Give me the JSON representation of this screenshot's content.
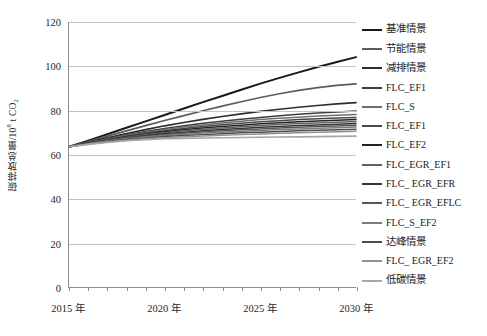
{
  "chart_data": {
    "type": "line",
    "title": "",
    "xlabel": "",
    "ylabel": "碳排放总量/10⁸ t CO₂",
    "ylabel_parts": {
      "prefix": "碳排放总量/10",
      "sup": "8",
      "mid": " t CO",
      "sub": "2"
    },
    "xlim": [
      2015,
      2030
    ],
    "ylim": [
      0,
      120
    ],
    "ytick_step": 20,
    "yticks": [
      0,
      20,
      40,
      60,
      80,
      100,
      120
    ],
    "ytick_labels": [
      "0",
      "20",
      "40",
      "60",
      "80",
      "100",
      "120"
    ],
    "xticks": [
      2015,
      2016,
      2017,
      2018,
      2019,
      2020,
      2021,
      2022,
      2023,
      2024,
      2025,
      2026,
      2027,
      2028,
      2029,
      2030
    ],
    "xtick_labels_shown": [
      "2015 年",
      "2020 年",
      "2025 年",
      "2030 年"
    ],
    "xtick_label_values": [
      2015,
      2020,
      2025,
      2030
    ],
    "grid": true,
    "grid_axis": "y",
    "legend_position": "right",
    "x": [
      2015,
      2016,
      2017,
      2018,
      2019,
      2020,
      2021,
      2022,
      2023,
      2024,
      2025,
      2026,
      2027,
      2028,
      2029,
      2030
    ],
    "series": [
      {
        "name": "基准情景",
        "color": "#1a1a1a",
        "width": 2.0,
        "values": [
          63.5,
          66.3,
          69.2,
          72.1,
          75.0,
          77.9,
          80.8,
          83.7,
          86.5,
          89.3,
          92.1,
          94.7,
          97.2,
          99.6,
          101.9,
          104.1
        ]
      },
      {
        "name": "节能情景",
        "color": "#5c5c5c",
        "width": 1.7,
        "values": [
          63.5,
          65.9,
          68.3,
          70.7,
          73.1,
          75.4,
          77.6,
          79.8,
          81.9,
          83.9,
          85.8,
          87.5,
          89.0,
          90.3,
          91.3,
          92.0
        ]
      },
      {
        "name": "减排情景",
        "color": "#2e2e2e",
        "width": 1.7,
        "values": [
          63.5,
          65.6,
          67.6,
          69.5,
          71.3,
          73.0,
          74.5,
          75.9,
          77.2,
          78.4,
          79.5,
          80.5,
          81.4,
          82.2,
          82.9,
          83.5
        ]
      },
      {
        "name": "FLC_EF1",
        "color": "#3c3c3c",
        "width": 1.5,
        "values": [
          63.5,
          65.4,
          67.2,
          68.9,
          70.4,
          71.8,
          73.0,
          74.1,
          75.1,
          76.0,
          76.8,
          77.5,
          78.2,
          78.8,
          79.3,
          79.7
        ]
      },
      {
        "name": "FLC_S",
        "color": "#707070",
        "width": 1.5,
        "values": [
          63.5,
          65.3,
          67.0,
          68.6,
          70.0,
          71.3,
          72.4,
          73.4,
          74.3,
          75.1,
          75.8,
          76.4,
          76.9,
          77.4,
          77.8,
          78.1
        ]
      },
      {
        "name": "FLC_EF1",
        "color": "#4a4a4a",
        "width": 1.5,
        "values": [
          63.5,
          65.2,
          66.8,
          68.3,
          69.6,
          70.8,
          71.8,
          72.7,
          73.5,
          74.2,
          74.8,
          75.3,
          75.8,
          76.2,
          76.5,
          76.8
        ]
      },
      {
        "name": "FLC_EF2",
        "color": "#242424",
        "width": 1.5,
        "values": [
          63.5,
          65.1,
          66.6,
          68.0,
          69.2,
          70.3,
          71.2,
          72.0,
          72.7,
          73.3,
          73.9,
          74.4,
          74.8,
          75.2,
          75.5,
          75.8
        ]
      },
      {
        "name": "FLC_EGR_EF1",
        "color": "#636363",
        "width": 1.5,
        "values": [
          63.5,
          65.1,
          66.5,
          67.8,
          68.9,
          69.9,
          70.7,
          71.4,
          72.0,
          72.6,
          73.1,
          73.6,
          74.0,
          74.3,
          74.6,
          74.9
        ]
      },
      {
        "name": "FLC_ EGR_EFR",
        "color": "#343434",
        "width": 1.5,
        "values": [
          63.5,
          65.0,
          66.3,
          67.5,
          68.5,
          69.4,
          70.1,
          70.7,
          71.3,
          71.8,
          72.3,
          72.7,
          73.1,
          73.4,
          73.7,
          74.0
        ]
      },
      {
        "name": "FLC_ EGR_EFLC",
        "color": "#575757",
        "width": 1.5,
        "values": [
          63.5,
          64.9,
          66.2,
          67.3,
          68.2,
          69.0,
          69.6,
          70.2,
          70.7,
          71.2,
          71.6,
          72.0,
          72.3,
          72.7,
          72.9,
          73.2
        ]
      },
      {
        "name": "FLC_S_EF2",
        "color": "#7d7d7d",
        "width": 1.5,
        "values": [
          63.5,
          64.9,
          66.1,
          67.1,
          67.9,
          68.6,
          69.2,
          69.7,
          70.1,
          70.5,
          70.9,
          71.3,
          71.6,
          71.9,
          72.1,
          72.4
        ]
      },
      {
        "name": "达峰情景",
        "color": "#4f4f4f",
        "width": 1.5,
        "values": [
          63.5,
          64.8,
          65.9,
          66.8,
          67.5,
          68.1,
          68.6,
          69.0,
          69.4,
          69.8,
          70.1,
          70.4,
          70.7,
          71.0,
          71.2,
          71.4
        ]
      },
      {
        "name": "FLC_ EGR_EF2",
        "color": "#909090",
        "width": 1.5,
        "values": [
          63.5,
          64.7,
          65.7,
          66.5,
          67.1,
          67.6,
          68.0,
          68.4,
          68.7,
          69.0,
          69.3,
          69.6,
          69.9,
          70.1,
          70.3,
          70.5
        ]
      },
      {
        "name": "低碳情景",
        "color": "#a6a6a6",
        "width": 1.6,
        "values": [
          63.5,
          64.6,
          65.5,
          66.2,
          66.7,
          67.1,
          67.3,
          67.5,
          67.6,
          67.7,
          67.8,
          67.9,
          68.0,
          68.1,
          68.2,
          68.3
        ]
      }
    ]
  },
  "legend": {
    "items": [
      {
        "label": "基准情景",
        "color": "#1a1a1a",
        "cjk": true
      },
      {
        "label": "节能情景",
        "color": "#5c5c5c",
        "cjk": true
      },
      {
        "label": "减排情景",
        "color": "#2e2e2e",
        "cjk": true
      },
      {
        "label": "FLC_EF1",
        "color": "#3c3c3c",
        "cjk": false
      },
      {
        "label": "FLC_S",
        "color": "#707070",
        "cjk": false
      },
      {
        "label": "FLC_EF1",
        "color": "#4a4a4a",
        "cjk": false
      },
      {
        "label": "FLC_EF2",
        "color": "#242424",
        "cjk": false
      },
      {
        "label": "FLC_EGR_EF1",
        "color": "#636363",
        "cjk": false
      },
      {
        "label": "FLC_ EGR_EFR",
        "color": "#343434",
        "cjk": false
      },
      {
        "label": "FLC_ EGR_EFLC",
        "color": "#575757",
        "cjk": false
      },
      {
        "label": "FLC_S_EF2",
        "color": "#7d7d7d",
        "cjk": false
      },
      {
        "label": "达峰情景",
        "color": "#4f4f4f",
        "cjk": true
      },
      {
        "label": "FLC_ EGR_EF2",
        "color": "#909090",
        "cjk": false
      },
      {
        "label": "低碳情景",
        "color": "#a6a6a6",
        "cjk": true
      }
    ]
  }
}
